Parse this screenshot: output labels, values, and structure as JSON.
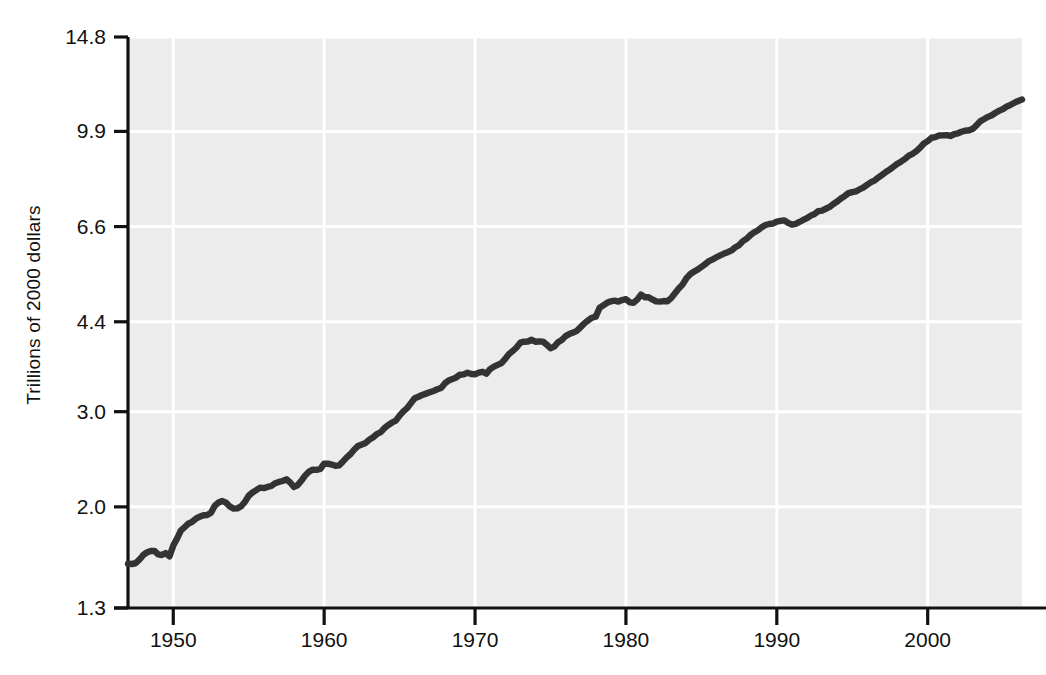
{
  "chart_data": {
    "type": "line",
    "title": "",
    "xlabel": "",
    "ylabel": "Trillions of 2000 dollars",
    "yscale": "log",
    "ylim": [
      1.3,
      14.8
    ],
    "xlim": [
      1947,
      2006.25
    ],
    "grid": true,
    "legend": "none",
    "line_color": "#333333",
    "plot_bg_color": "#ececec",
    "grid_color": "#ffffff",
    "axis_color": "#111111",
    "y_ticks": [
      1.3,
      2.0,
      3.0,
      4.4,
      6.6,
      9.9,
      14.8
    ],
    "y_tick_labels": [
      "1.3",
      "2.0",
      "3.0",
      "4.4",
      "6.6",
      "9.9",
      "14.8"
    ],
    "x_ticks": [
      1950,
      1960,
      1970,
      1980,
      1990,
      2000
    ],
    "x_tick_labels": [
      "1950",
      "1960",
      "1970",
      "1980",
      "1990",
      "2000"
    ],
    "series": [
      {
        "name": "Real GDP",
        "x": [
          1947.0,
          1947.25,
          1947.5,
          1947.75,
          1948.0,
          1948.25,
          1948.5,
          1948.75,
          1949.0,
          1949.25,
          1949.5,
          1949.75,
          1950.0,
          1950.25,
          1950.5,
          1950.75,
          1951.0,
          1951.25,
          1951.5,
          1951.75,
          1952.0,
          1952.25,
          1952.5,
          1952.75,
          1953.0,
          1953.25,
          1953.5,
          1953.75,
          1954.0,
          1954.25,
          1954.5,
          1954.75,
          1955.0,
          1955.25,
          1955.5,
          1955.75,
          1956.0,
          1956.25,
          1956.5,
          1956.75,
          1957.0,
          1957.25,
          1957.5,
          1957.75,
          1958.0,
          1958.25,
          1958.5,
          1958.75,
          1959.0,
          1959.25,
          1959.5,
          1959.75,
          1960.0,
          1960.25,
          1960.5,
          1960.75,
          1961.0,
          1961.25,
          1961.5,
          1961.75,
          1962.0,
          1962.25,
          1962.5,
          1962.75,
          1963.0,
          1963.25,
          1963.5,
          1963.75,
          1964.0,
          1964.25,
          1964.5,
          1964.75,
          1965.0,
          1965.25,
          1965.5,
          1965.75,
          1966.0,
          1966.25,
          1966.5,
          1966.75,
          1967.0,
          1967.25,
          1967.5,
          1967.75,
          1968.0,
          1968.25,
          1968.5,
          1968.75,
          1969.0,
          1969.25,
          1969.5,
          1969.75,
          1970.0,
          1970.25,
          1970.5,
          1970.75,
          1971.0,
          1971.25,
          1971.5,
          1971.75,
          1972.0,
          1972.25,
          1972.5,
          1972.75,
          1973.0,
          1973.25,
          1973.5,
          1973.75,
          1974.0,
          1974.25,
          1974.5,
          1974.75,
          1975.0,
          1975.25,
          1975.5,
          1975.75,
          1976.0,
          1976.25,
          1976.5,
          1976.75,
          1977.0,
          1977.25,
          1977.5,
          1977.75,
          1978.0,
          1978.25,
          1978.5,
          1978.75,
          1979.0,
          1979.25,
          1979.5,
          1979.75,
          1980.0,
          1980.25,
          1980.5,
          1980.75,
          1981.0,
          1981.25,
          1981.5,
          1981.75,
          1982.0,
          1982.25,
          1982.5,
          1982.75,
          1983.0,
          1983.25,
          1983.5,
          1983.75,
          1984.0,
          1984.25,
          1984.5,
          1984.75,
          1985.0,
          1985.25,
          1985.5,
          1985.75,
          1986.0,
          1986.25,
          1986.5,
          1986.75,
          1987.0,
          1987.25,
          1987.5,
          1987.75,
          1988.0,
          1988.25,
          1988.5,
          1988.75,
          1989.0,
          1989.25,
          1989.5,
          1989.75,
          1990.0,
          1990.25,
          1990.5,
          1990.75,
          1991.0,
          1991.25,
          1991.5,
          1991.75,
          1992.0,
          1992.25,
          1992.5,
          1992.75,
          1993.0,
          1993.25,
          1993.5,
          1993.75,
          1994.0,
          1994.25,
          1994.5,
          1994.75,
          1995.0,
          1995.25,
          1995.5,
          1995.75,
          1996.0,
          1996.25,
          1996.5,
          1996.75,
          1997.0,
          1997.25,
          1997.5,
          1997.75,
          1998.0,
          1998.25,
          1998.5,
          1998.75,
          1999.0,
          1999.25,
          1999.5,
          1999.75,
          2000.0,
          2000.25,
          2000.5,
          2000.75,
          2001.0,
          2001.25,
          2001.5,
          2001.75,
          2002.0,
          2002.25,
          2002.5,
          2002.75,
          2003.0,
          2003.25,
          2003.5,
          2003.75,
          2004.0,
          2004.25,
          2004.5,
          2004.75,
          2005.0,
          2005.25,
          2005.5,
          2005.75,
          2006.0,
          2006.25
        ],
        "values": [
          1.57,
          1.568,
          1.573,
          1.597,
          1.628,
          1.647,
          1.657,
          1.658,
          1.634,
          1.629,
          1.643,
          1.62,
          1.696,
          1.747,
          1.808,
          1.834,
          1.862,
          1.877,
          1.902,
          1.918,
          1.93,
          1.932,
          1.95,
          2.01,
          2.037,
          2.05,
          2.036,
          2.003,
          1.985,
          1.987,
          2.005,
          2.043,
          2.097,
          2.126,
          2.148,
          2.171,
          2.166,
          2.177,
          2.186,
          2.212,
          2.224,
          2.233,
          2.249,
          2.219,
          2.177,
          2.195,
          2.238,
          2.287,
          2.325,
          2.344,
          2.341,
          2.351,
          2.404,
          2.405,
          2.395,
          2.382,
          2.387,
          2.427,
          2.47,
          2.505,
          2.554,
          2.593,
          2.609,
          2.626,
          2.663,
          2.691,
          2.728,
          2.75,
          2.798,
          2.834,
          2.865,
          2.888,
          2.951,
          3.003,
          3.045,
          3.111,
          3.176,
          3.197,
          3.222,
          3.24,
          3.259,
          3.277,
          3.3,
          3.318,
          3.384,
          3.426,
          3.447,
          3.471,
          3.512,
          3.517,
          3.541,
          3.523,
          3.518,
          3.544,
          3.556,
          3.526,
          3.597,
          3.635,
          3.663,
          3.689,
          3.757,
          3.836,
          3.884,
          3.944,
          4.026,
          4.042,
          4.046,
          4.075,
          4.042,
          4.045,
          4.044,
          3.991,
          3.93,
          3.957,
          4.033,
          4.072,
          4.139,
          4.177,
          4.202,
          4.233,
          4.301,
          4.373,
          4.426,
          4.477,
          4.498,
          4.667,
          4.719,
          4.771,
          4.801,
          4.815,
          4.796,
          4.827,
          4.845,
          4.78,
          4.772,
          4.835,
          4.94,
          4.885,
          4.885,
          4.84,
          4.8,
          4.795,
          4.806,
          4.801,
          4.866,
          4.969,
          5.069,
          5.154,
          5.291,
          5.387,
          5.444,
          5.494,
          5.557,
          5.624,
          5.698,
          5.741,
          5.791,
          5.839,
          5.883,
          5.917,
          5.963,
          6.042,
          6.097,
          6.204,
          6.265,
          6.364,
          6.441,
          6.497,
          6.579,
          6.645,
          6.674,
          6.687,
          6.743,
          6.76,
          6.776,
          6.705,
          6.654,
          6.678,
          6.731,
          6.789,
          6.841,
          6.916,
          6.964,
          7.048,
          7.066,
          7.121,
          7.176,
          7.266,
          7.343,
          7.439,
          7.516,
          7.611,
          7.646,
          7.67,
          7.736,
          7.8,
          7.893,
          7.977,
          8.039,
          8.142,
          8.236,
          8.336,
          8.422,
          8.525,
          8.63,
          8.713,
          8.806,
          8.931,
          9.0,
          9.105,
          9.237,
          9.403,
          9.497,
          9.635,
          9.661,
          9.726,
          9.733,
          9.745,
          9.709,
          9.781,
          9.819,
          9.886,
          9.929,
          9.947,
          10.012,
          10.177,
          10.345,
          10.436,
          10.533,
          10.607,
          10.717,
          10.815,
          10.89,
          11.009,
          11.087,
          11.188,
          11.269,
          11.337
        ]
      }
    ]
  },
  "axes": {
    "y_axis_title": "Trillions of 2000 dollars",
    "y_tick_labels": [
      "14.8",
      "9.9",
      "6.6",
      "4.4",
      "3.0",
      "2.0",
      "1.3"
    ],
    "x_tick_labels": [
      "1950",
      "1960",
      "1970",
      "1980",
      "1990",
      "2000"
    ]
  }
}
